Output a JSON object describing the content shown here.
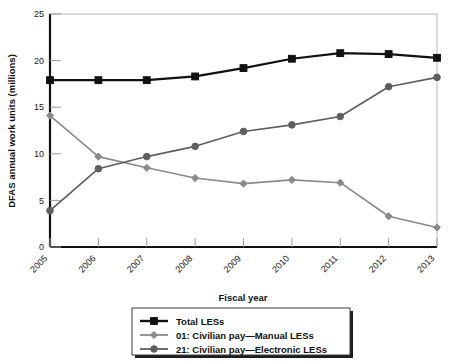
{
  "chart_data": {
    "type": "line",
    "title": "",
    "xlabel": "Fiscal year",
    "ylabel": "DFAS annual work units (millions)",
    "x": [
      "2005",
      "2006",
      "2007",
      "2008",
      "2009",
      "2010",
      "2011",
      "2012",
      "2013"
    ],
    "categories": [
      "2005",
      "2006",
      "2007",
      "2008",
      "2009",
      "2010",
      "2011",
      "2012",
      "2013"
    ],
    "xlim": [
      2005,
      2013
    ],
    "ylim": [
      0,
      25
    ],
    "yticks": [
      0,
      5,
      10,
      15,
      20,
      25
    ],
    "ytick_labels": [
      "0",
      "5",
      "10",
      "15",
      "20",
      "25"
    ],
    "grid": false,
    "legend_position": "bottom-center",
    "series": [
      {
        "name": "Total LESs",
        "color": "#111111",
        "marker": "square",
        "values": [
          17.9,
          17.9,
          17.9,
          18.3,
          19.2,
          20.2,
          20.8,
          20.7,
          20.3
        ]
      },
      {
        "name": "01: Civilian pay—Manual LESs",
        "color": "#8a8a8a",
        "marker": "diamond",
        "values": [
          14.1,
          9.7,
          8.5,
          7.4,
          6.8,
          7.2,
          6.9,
          3.3,
          2.1
        ]
      },
      {
        "name": "21: Civilian pay—Electronic LESs",
        "color": "#5e5e5e",
        "marker": "circle",
        "values": [
          3.9,
          8.4,
          9.7,
          10.8,
          12.4,
          13.1,
          14.0,
          17.2,
          18.2
        ]
      }
    ]
  },
  "axes": {
    "y_title": "DFAS annual work units (millions)",
    "x_title": "Fiscal year"
  },
  "legend": {
    "items": [
      {
        "label": "Total LESs",
        "marker": "square",
        "color": "#111111"
      },
      {
        "label": "01: Civilian pay—Manual LESs",
        "marker": "diamond",
        "color": "#8a8a8a"
      },
      {
        "label": "21: Civilian pay—Electronic LESs",
        "marker": "circle",
        "color": "#5e5e5e"
      }
    ]
  }
}
